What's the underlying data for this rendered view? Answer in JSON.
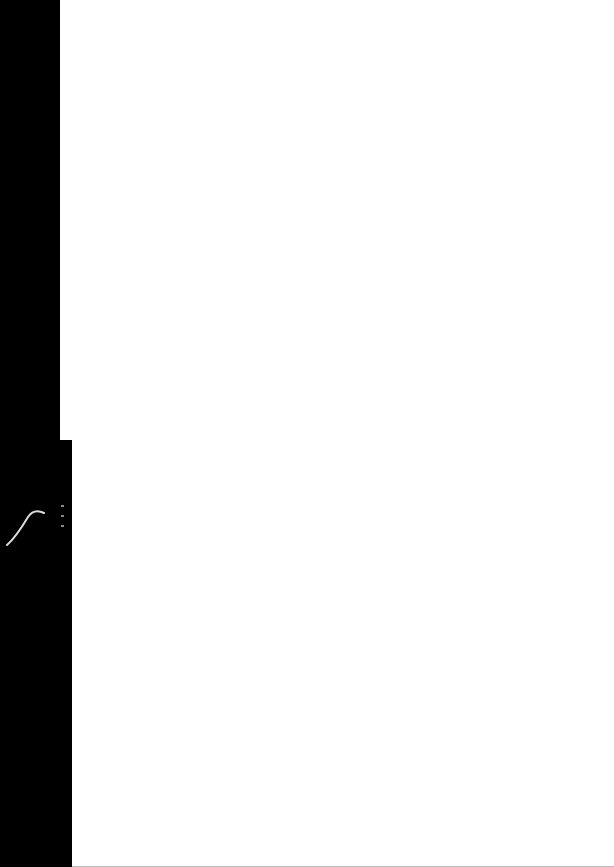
{
  "document": {
    "type": "scanned-page",
    "content": "",
    "page_color": "#ffffff",
    "background_color": "#000000"
  },
  "icons": {
    "mark": "curl-mark-icon"
  }
}
